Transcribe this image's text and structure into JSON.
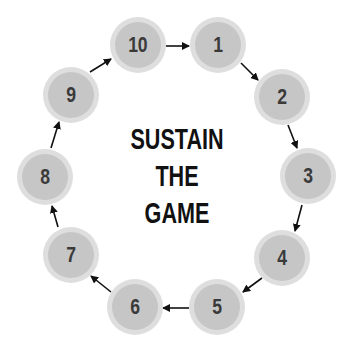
{
  "title": {
    "lines": [
      "SUSTAIN",
      "THE",
      "GAME"
    ]
  },
  "colors": {
    "node_outer": "#dedede",
    "node_inner": "#c6c6c6",
    "node_text": "#3a3a3a",
    "title_text": "#111111",
    "arrow": "#111111"
  },
  "nodes": [
    {
      "label": "1",
      "cx": 218,
      "cy": 45
    },
    {
      "label": "2",
      "cx": 282,
      "cy": 97
    },
    {
      "label": "3",
      "cx": 308,
      "cy": 176
    },
    {
      "label": "4",
      "cx": 282,
      "cy": 258
    },
    {
      "label": "5",
      "cx": 217,
      "cy": 307
    },
    {
      "label": "6",
      "cx": 135,
      "cy": 307
    },
    {
      "label": "7",
      "cx": 71,
      "cy": 255
    },
    {
      "label": "8",
      "cx": 45,
      "cy": 177
    },
    {
      "label": "9",
      "cx": 71,
      "cy": 95
    },
    {
      "label": "10",
      "cx": 138,
      "cy": 45
    }
  ],
  "flow": [
    "1→2",
    "2→3",
    "3→4",
    "4→5",
    "5→6",
    "6→7",
    "7→8",
    "8→9",
    "9→10",
    "10→1"
  ]
}
